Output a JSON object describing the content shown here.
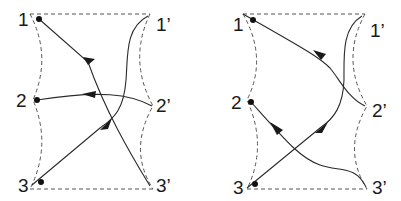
{
  "diagram": {
    "panels": [
      {
        "id": "left",
        "labels": {
          "p1": "1",
          "p2": "2",
          "p3": "3",
          "q1": "1’",
          "q2": "2’",
          "q3": "3’"
        },
        "connections": [
          "3’ → 1",
          "2’ → 2",
          "1’ → 3"
        ]
      },
      {
        "id": "right",
        "labels": {
          "p1": "1",
          "p2": "2",
          "p3": "3",
          "q1": "1’",
          "q2": "2’",
          "q3": "3’"
        },
        "connections": [
          "2’ → 1",
          "3’ → 2",
          "1’ → 3"
        ]
      }
    ],
    "colors": {
      "line": "#2a2a2a",
      "dashed": "#555555",
      "background": "#ffffff"
    }
  }
}
